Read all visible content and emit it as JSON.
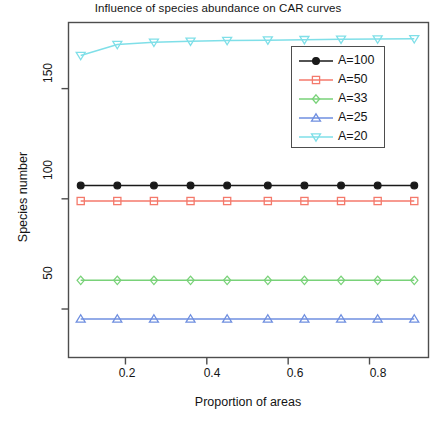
{
  "chart_data": {
    "type": "line",
    "title": "Influence of species abundance on CAR curves",
    "xlabel": "Proportion of areas",
    "ylabel": "Species number",
    "xlim": [
      0.06,
      0.945
    ],
    "ylim": [
      28,
      180
    ],
    "xticks": [
      0.2,
      0.4,
      0.6,
      0.8
    ],
    "xtick_labels": [
      "0.2",
      "0.4",
      "0.6",
      "0.8"
    ],
    "yticks": [
      50,
      100,
      150
    ],
    "ytick_labels": [
      "50",
      "100",
      "150"
    ],
    "grid": false,
    "legend_position": "top-right-inside",
    "x": [
      0.09,
      0.18,
      0.27,
      0.36,
      0.45,
      0.55,
      0.64,
      0.73,
      0.82,
      0.91
    ],
    "series": [
      {
        "name": "A=100",
        "color": "#1a1a1a",
        "marker": "filled-circle",
        "values": [
          106,
          106,
          106,
          106,
          106,
          106,
          106,
          106,
          106,
          106
        ]
      },
      {
        "name": "A=50",
        "color": "#f4796b",
        "marker": "square",
        "values": [
          99,
          99,
          99,
          99,
          99,
          99,
          99,
          99,
          99,
          99
        ]
      },
      {
        "name": "A=33",
        "color": "#79d279",
        "marker": "diamond",
        "values": [
          63,
          63,
          63,
          63,
          63,
          63,
          63,
          63,
          63,
          63
        ]
      },
      {
        "name": "A=25",
        "color": "#6f8fe0",
        "marker": "triangle-up",
        "values": [
          45.5,
          45.5,
          45.5,
          45.5,
          45.5,
          45.5,
          45.5,
          45.5,
          45.5,
          45.5
        ]
      },
      {
        "name": "A=20",
        "color": "#7fdfe8",
        "marker": "triangle-down",
        "values": [
          165,
          170,
          171,
          171.5,
          171.8,
          172,
          172.2,
          172.4,
          172.5,
          172.6
        ]
      }
    ]
  },
  "legend": {
    "entries": [
      {
        "label": "A=100"
      },
      {
        "label": "A=50"
      },
      {
        "label": "A=33"
      },
      {
        "label": "A=25"
      },
      {
        "label": "A=20"
      }
    ]
  },
  "axes": {
    "x_tick_labels": [
      "0.2",
      "0.4",
      "0.6",
      "0.8"
    ],
    "y_tick_labels": [
      "50",
      "100",
      "150"
    ]
  }
}
